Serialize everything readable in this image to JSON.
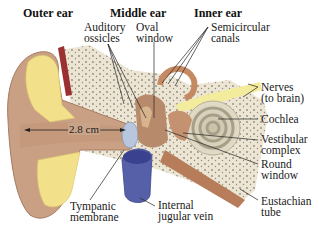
{
  "diagram": {
    "type": "anatomical-cross-section",
    "regions": [
      {
        "id": "outer",
        "label": "Outer ear"
      },
      {
        "id": "middle",
        "label": "Middle ear"
      },
      {
        "id": "inner",
        "label": "Inner ear"
      }
    ],
    "labels": [
      {
        "id": "auditory-ossicles",
        "lines": [
          "Auditory",
          "ossicles"
        ]
      },
      {
        "id": "oval-window",
        "lines": [
          "Oval",
          "window"
        ]
      },
      {
        "id": "semicircular-canals",
        "lines": [
          "Semicircular",
          "canals"
        ]
      },
      {
        "id": "nerves",
        "lines": [
          "Nerves",
          "(to brain)"
        ]
      },
      {
        "id": "cochlea",
        "lines": [
          "Cochlea"
        ]
      },
      {
        "id": "vestibular-complex",
        "lines": [
          "Vestibular",
          "complex"
        ]
      },
      {
        "id": "round-window",
        "lines": [
          "Round",
          "window"
        ]
      },
      {
        "id": "eustachian-tube",
        "lines": [
          "Eustachian",
          "tube"
        ]
      },
      {
        "id": "internal-jugular-vein",
        "lines": [
          "Internal",
          "jugular vein"
        ]
      },
      {
        "id": "tympanic-membrane",
        "lines": [
          "Tympanic",
          "membrane"
        ]
      }
    ],
    "measurement": {
      "label": "2.8 cm",
      "describes": "ear canal length"
    },
    "colors": {
      "skin": "#c9a083",
      "skin_dark": "#a87c62",
      "fat": "#f2e08a",
      "bone": "#ece5d3",
      "bone_dots": "#8f8a7c",
      "vein": "#5560a8",
      "nerve": "#f3ec9c",
      "membrane": "#b8c6de",
      "cochlea": "#d9d2bd",
      "muscle": "#9a3030"
    }
  }
}
